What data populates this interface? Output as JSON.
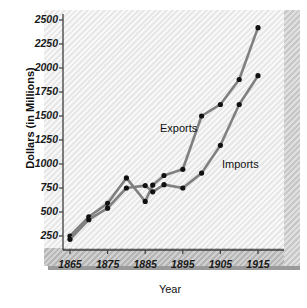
{
  "chart_data": {
    "type": "line",
    "title": "",
    "xlabel": "Year",
    "ylabel": "Dollars (in Millions)",
    "xlim": [
      1863,
      1917
    ],
    "ylim": [
      0,
      2500
    ],
    "xticks": [
      1865,
      1875,
      1885,
      1895,
      1905,
      1915
    ],
    "yticks": [
      250,
      500,
      750,
      1000,
      1250,
      1500,
      1750,
      2000,
      2250,
      2500
    ],
    "grid": false,
    "legend_position": "inline-annotation",
    "series": [
      {
        "name": "Exports",
        "color": "#808080",
        "marker_color": "#111111",
        "x": [
          1865,
          1870,
          1875,
          1880,
          1885,
          1887,
          1890,
          1895,
          1900,
          1905,
          1910,
          1915
        ],
        "y": [
          250,
          450,
          590,
          855,
          610,
          780,
          880,
          945,
          1500,
          1620,
          1880,
          2420
        ]
      },
      {
        "name": "Imports",
        "color": "#808080",
        "marker_color": "#111111",
        "x": [
          1865,
          1870,
          1875,
          1880,
          1885,
          1887,
          1890,
          1895,
          1900,
          1905,
          1910,
          1915
        ],
        "y": [
          215,
          420,
          540,
          750,
          775,
          710,
          785,
          750,
          905,
          1195,
          1620,
          1920
        ]
      }
    ],
    "annotations": [
      {
        "text": "Exports",
        "x_px": 160,
        "y_px": 122
      },
      {
        "text": "Imports",
        "x_px": 222,
        "y_px": 158
      }
    ]
  },
  "axis": {
    "y_tick_labels": [
      "2500",
      "2250",
      "2000",
      "1750",
      "1500",
      "1250",
      "1000",
      "750",
      "500",
      "250"
    ],
    "x_tick_labels": [
      "1865",
      "1875",
      "1885",
      "1895",
      "1905",
      "1915"
    ],
    "x_title": "Year",
    "y_title": "Dollars (in Millions)"
  },
  "colors": {
    "line": "#808080",
    "marker": "#111111",
    "panel": "#efefef",
    "panel_shadow": "#9a9a9a",
    "axis": "#3c3c3c",
    "text": "#111111"
  }
}
